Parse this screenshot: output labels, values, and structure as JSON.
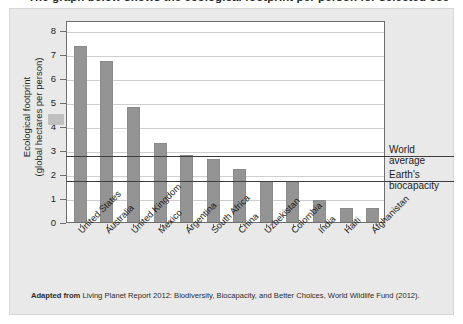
{
  "figure": {
    "clipped_title": "The graph below shows the ecological footprint per person for selected countries.",
    "source_prefix": "Adapted from",
    "source_text": "Living Planet Report 2012: Biodiversity, Biocapacity, and Better Choices, World Wildlife Fund (2012)."
  },
  "colors": {
    "bar": "#949494",
    "card_background": "#e9e9e9",
    "panel_background": "#ffffff",
    "gridline": "#cfcfcf",
    "reference_line": "#3d3d3d",
    "axis": "#6e6e6e",
    "text": "#1d1d1d"
  },
  "chart_data": {
    "type": "bar",
    "title": "",
    "xlabel": "",
    "ylabel": "Ecological footprint (global hectares per person)",
    "ylabel_line1": "Ecological footprint",
    "ylabel_line2": "(global hectares per person)",
    "ylim": [
      0,
      8.4
    ],
    "yticks": [
      0,
      1,
      2,
      3,
      4,
      5,
      6,
      7,
      8
    ],
    "ytick_labels": [
      "0",
      "1",
      "2",
      "3",
      "4",
      "5",
      "6",
      "7",
      "8"
    ],
    "grid": true,
    "legend": "none",
    "categories": [
      "United States",
      "Australia",
      "United Kingdom",
      "Mexico",
      "Argentina",
      "South Africa",
      "China",
      "Uzbekistan",
      "Colombia",
      "India",
      "Haiti",
      "Afghanistan"
    ],
    "values": [
      7.3,
      6.7,
      4.8,
      3.3,
      2.8,
      2.6,
      2.2,
      1.7,
      1.7,
      0.9,
      0.6,
      0.6
    ],
    "annotations": [
      {
        "label": "World average",
        "label_line1": "World",
        "label_line2": "average",
        "value": 2.8
      },
      {
        "label": "Earth's biocapacity",
        "label_line1": "Earth's",
        "label_line2": "biocapacity",
        "value": 1.75
      }
    ]
  }
}
